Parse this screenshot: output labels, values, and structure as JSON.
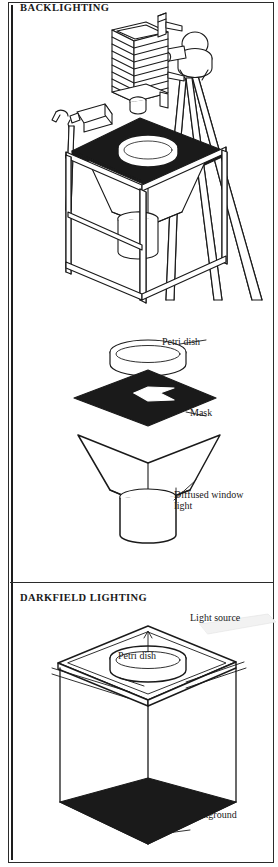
{
  "figure": {
    "kind": "technical-line-illustration",
    "panel_count": 3,
    "stroke_color": "#1a1a1a",
    "fill_dark": "#1a1a1a",
    "fill_light": "#ffffff",
    "background": "#ffffff"
  },
  "sections": {
    "backlighting": {
      "title": "BACKLIGHTING",
      "parts": [
        "bellows-camera",
        "tripod",
        "ball-head",
        "clamp-lamp",
        "dark-table-top",
        "petri-dish",
        "light-funnel",
        "frame-stand"
      ]
    },
    "exploded": {
      "labels": {
        "petri_dish": "Petri dish",
        "mask": "Mask",
        "diffused_window_light": "Diffused window\nlight"
      },
      "parts": [
        "petri-dish-ring",
        "black-mask-with-square-aperture",
        "light-funnel-hopper",
        "light-column"
      ]
    },
    "darkfield": {
      "title": "DARKFIELD LIGHTING",
      "labels": {
        "light_source": "Light source",
        "petri_dish": "Petri dish",
        "dark_background": "Dark background"
      },
      "parts": [
        "glass-table-top",
        "petri-dish",
        "open-box-stand",
        "dark-background-panel",
        "light-beam"
      ]
    }
  }
}
